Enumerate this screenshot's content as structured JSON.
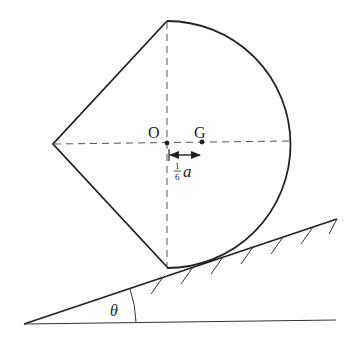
{
  "diagram": {
    "type": "mechanics-figure",
    "labels": {
      "center": "O",
      "centroid": "G",
      "offset_numerator": "1",
      "offset_denominator": "6",
      "offset_var": "a",
      "angle": "θ"
    },
    "points": {
      "top_vertex": [
        165,
        20
      ],
      "left_vertex": [
        53,
        144
      ],
      "bottom_vertex": [
        168,
        269
      ],
      "O": [
        167,
        143
      ],
      "G": [
        202,
        142
      ]
    },
    "incline": {
      "apex": [
        24,
        324
      ],
      "top_end": [
        337,
        219
      ],
      "baseline_end": [
        336,
        320
      ]
    },
    "colors": {
      "stroke": "#222222",
      "dashed": "#555555",
      "background": "#ffffff"
    }
  }
}
